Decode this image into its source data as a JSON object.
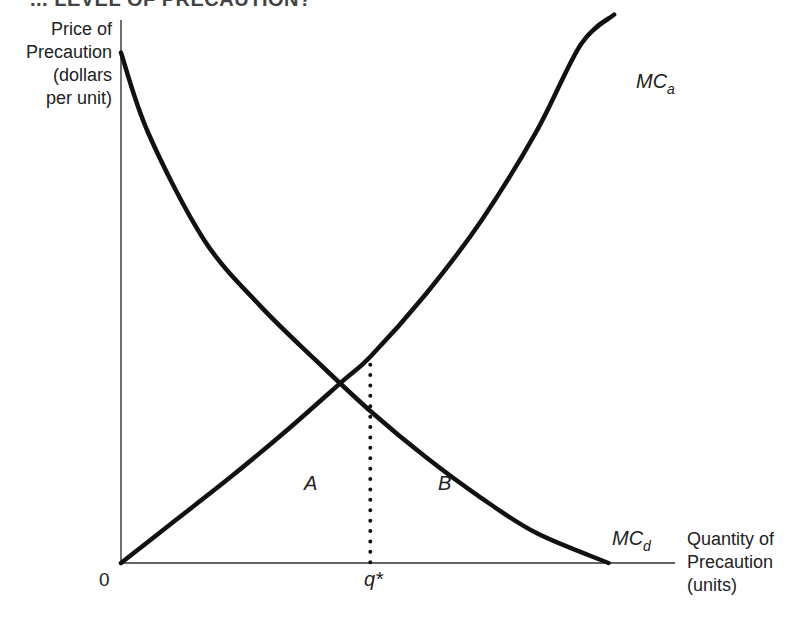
{
  "title_partial": "... LEVEL OF PRECAUTION?",
  "chart_data": {
    "type": "line",
    "title": "",
    "ylabel": [
      "Price of",
      "Precaution",
      "(dollars",
      "per unit)"
    ],
    "xlabel": [
      "Quantity of",
      "Precaution",
      "(units)"
    ],
    "origin_label": "0",
    "xlim": [
      0,
      10
    ],
    "ylim": [
      0,
      10
    ],
    "grid": false,
    "series": [
      {
        "name": "MC_d",
        "label_main": "MC",
        "label_sub": "d",
        "description": "Marginal cost of precaution (decreasing)",
        "x": [
          0.0,
          0.5,
          1.5,
          2.5,
          3.5,
          4.5,
          5.5,
          6.5,
          7.5,
          8.8
        ],
        "y": [
          9.4,
          7.9,
          5.95,
          4.75,
          3.75,
          2.8,
          1.95,
          1.2,
          0.55,
          0.0
        ]
      },
      {
        "name": "MC_a",
        "label_main": "MC",
        "label_sub": "a",
        "description": "Marginal cost of accidents (increasing)",
        "x": [
          0.0,
          1.0,
          2.0,
          3.0,
          4.0,
          4.5,
          5.5,
          6.5,
          7.5,
          8.3,
          8.9
        ],
        "y": [
          0.0,
          0.8,
          1.6,
          2.45,
          3.35,
          3.8,
          4.95,
          6.3,
          7.95,
          9.55,
          10.1
        ]
      }
    ],
    "annotations": [
      {
        "text": "q*",
        "type": "x-marker",
        "x": 4.5,
        "y": 3.8,
        "style": "dotted vertical line from intersection to x-axis"
      },
      {
        "text": "A",
        "region": "left of q*, below curves",
        "x": 3.45,
        "y": 1.5
      },
      {
        "text": "B",
        "region": "right of q*, below curves",
        "x": 5.8,
        "y": 1.5
      }
    ]
  }
}
